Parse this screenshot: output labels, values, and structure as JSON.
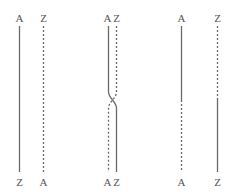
{
  "colors": {
    "line": "#6a6a6a",
    "label": "#555555",
    "background": "#ffffff"
  },
  "panels": [
    {
      "name": "parallel-strands",
      "top_labels": [
        "A",
        "Z"
      ],
      "bottom_labels": [
        "Z",
        "A"
      ],
      "strands": [
        {
          "x_top": 19,
          "x_bottom": 19,
          "style": "solid"
        },
        {
          "x_top": 43,
          "x_bottom": 43,
          "style": "dashed"
        }
      ]
    },
    {
      "name": "crossover-strands",
      "top_labels": [
        "A",
        "Z"
      ],
      "bottom_labels": [
        "A",
        "Z"
      ],
      "strands": [
        {
          "x_top": 108,
          "x_bottom": 116,
          "style": "solid",
          "cross_y": 100
        },
        {
          "x_top": 116,
          "x_bottom": 108,
          "style": "dashed",
          "cross_y": 100
        }
      ]
    },
    {
      "name": "switched-strands",
      "top_labels": [
        "A",
        "Z"
      ],
      "bottom_labels": [
        "A",
        "Z"
      ],
      "strands": [
        {
          "x": 181,
          "upper_style": "solid",
          "lower_style": "dashed",
          "switch_y": 100
        },
        {
          "x": 217,
          "upper_style": "dashed",
          "lower_style": "solid",
          "switch_y": 100
        }
      ]
    }
  ],
  "labels": {
    "p1_top_left": "A",
    "p1_top_right": "Z",
    "p1_bottom_left": "Z",
    "p1_bottom_right": "A",
    "p2_top_left": "A",
    "p2_top_right": "Z",
    "p2_bottom_left": "A",
    "p2_bottom_right": "Z",
    "p3_top_left": "A",
    "p3_top_right": "Z",
    "p3_bottom_left": "A",
    "p3_bottom_right": "Z"
  }
}
